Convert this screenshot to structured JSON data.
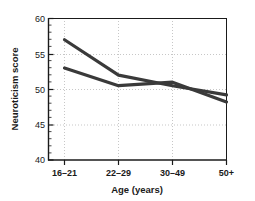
{
  "chart_data": {
    "type": "line",
    "title": "",
    "xlabel": "Age (years)",
    "ylabel": "Neuroticism score",
    "categories": [
      "16–21",
      "22–29",
      "30–49",
      "50+"
    ],
    "series": [
      {
        "name": "series-upper",
        "values": [
          57.0,
          52.0,
          50.5,
          49.2
        ],
        "color": "#3a3a3a"
      },
      {
        "name": "series-lower",
        "values": [
          53.0,
          50.5,
          51.0,
          48.2
        ],
        "color": "#3a3a3a"
      }
    ],
    "ylim": [
      40,
      60
    ],
    "yticks": [
      40,
      45,
      50,
      55,
      60
    ],
    "yticklabels": [
      "40",
      "45",
      "50",
      "55",
      "60"
    ],
    "yminor_step": 1,
    "grid": true,
    "grid_style": "dotted",
    "legend": "none",
    "axis_color": "#1a1a1a",
    "grid_color": "#b9b9b9",
    "background": "#ffffff"
  },
  "axis": {
    "y_tick_0": "40",
    "y_tick_1": "45",
    "y_tick_2": "50",
    "y_tick_3": "55",
    "y_tick_4": "60",
    "x_tick_0": "16–21",
    "x_tick_1": "22–29",
    "x_tick_2": "30–49",
    "x_tick_3": "50+",
    "x_title": "Age (years)",
    "y_title": "Neuroticism score"
  }
}
